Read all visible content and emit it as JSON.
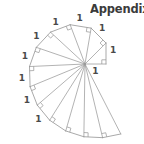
{
  "page": {
    "title": "Appendix.",
    "background_color": "#ffffff"
  },
  "heading": {
    "text": "Appendix.",
    "color": "#3b3b3b",
    "x": 90,
    "y": 3
  },
  "figure": {
    "name": "spiral-of-theodorus",
    "caption": "",
    "line_color": "#9a9a9a",
    "label_color": "#4a4a4a",
    "center": {
      "x": 85,
      "y": 64
    },
    "start_radius": 21,
    "start_angle_deg": 0,
    "triangle_count": 14,
    "leg_length_label": "1",
    "right_angle_marker_size": 4.2,
    "labels": {
      "leg": "1"
    }
  },
  "chart_data": {
    "type": "diagram",
    "unit_leg_labels": [
      "1",
      "1",
      "1",
      "1",
      "1",
      "1",
      "1",
      "1",
      "1"
    ],
    "hypotenuse_lengths": [
      1.414,
      1.732,
      2.0,
      2.236,
      2.449,
      2.646,
      2.828,
      3.0,
      3.162,
      3.317,
      3.464,
      3.606,
      3.742,
      3.873
    ],
    "radii_px": [
      21,
      29.7,
      36.37,
      42,
      46.96,
      51.44,
      55.56,
      59.4,
      63,
      66.41,
      69.65,
      72.75,
      75.74,
      78.61
    ],
    "angles_deg": [
      0,
      45,
      80.26,
      110.7,
      137.33,
      161.1,
      182.63,
      202.41,
      220.75,
      237.87,
      253.94,
      269.1,
      283.45,
      297.1
    ],
    "labeled_legs_visible": 9
  }
}
